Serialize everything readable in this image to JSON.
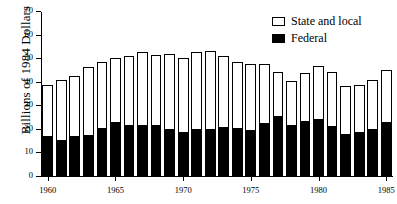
{
  "chart_data": {
    "type": "bar",
    "stacked": true,
    "title": "",
    "xlabel": "",
    "ylabel": "Billions of 1984 Dollars",
    "ylim": [
      0,
      70
    ],
    "ytick_labels": [
      "0",
      "10",
      "20",
      "30",
      "40",
      "50",
      "60",
      "70"
    ],
    "ytick_values": [
      0,
      10,
      20,
      30,
      40,
      50,
      60,
      70
    ],
    "xtick_labels": [
      "1960",
      "1965",
      "1970",
      "1975",
      "1980",
      "1985"
    ],
    "xtick_values": [
      1960,
      1965,
      1970,
      1975,
      1980,
      1985
    ],
    "grid": false,
    "legend_position": "top-right",
    "categories": [
      "1960",
      "1961",
      "1962",
      "1963",
      "1964",
      "1965",
      "1966",
      "1967",
      "1968",
      "1969",
      "1970",
      "1971",
      "1972",
      "1973",
      "1974",
      "1975",
      "1976",
      "1977",
      "1978",
      "1979",
      "1980",
      "1981",
      "1982",
      "1983",
      "1984",
      "1985"
    ],
    "series": [
      {
        "name": "Federal",
        "color": "#000000",
        "values": [
          17.2,
          15.8,
          17.2,
          18.0,
          21.0,
          23.2,
          22.2,
          22.2,
          21.9,
          20.3,
          19.0,
          20.5,
          20.3,
          21.4,
          20.7,
          20.0,
          23.0,
          25.8,
          21.9,
          23.9,
          24.7,
          21.6,
          18.3,
          19.2,
          20.4,
          23.5
        ]
      },
      {
        "name": "State and local",
        "color": "#ffffff",
        "values": [
          21.9,
          25.2,
          25.8,
          28.7,
          27.8,
          27.4,
          29.1,
          30.9,
          29.9,
          31.9,
          31.4,
          32.7,
          33.3,
          30.1,
          28.1,
          27.8,
          24.8,
          18.6,
          18.9,
          20.4,
          22.2,
          23.0,
          20.4,
          19.9,
          20.9,
          21.7
        ]
      }
    ],
    "totals": [
      39.1,
      41.0,
      43.0,
      46.7,
      48.8,
      50.6,
      51.3,
      53.1,
      51.8,
      52.2,
      50.4,
      53.2,
      53.6,
      51.5,
      48.8,
      47.8,
      47.8,
      44.4,
      40.8,
      44.3,
      46.9,
      44.6,
      38.7,
      39.1,
      41.3,
      45.2
    ]
  },
  "legend": {
    "entries": [
      {
        "label": "State and local",
        "style": "open"
      },
      {
        "label": "Federal",
        "style": "filled"
      }
    ]
  }
}
